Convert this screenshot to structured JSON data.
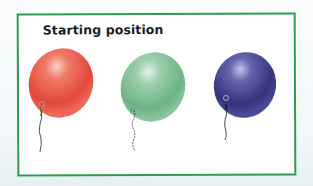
{
  "diagram": {
    "title": "Starting position",
    "frame_color": "#2f9a52",
    "balloons": [
      {
        "label": "red-balloon",
        "color": "#e8584a",
        "highlight": "#f9c2b8",
        "shade": "#c83a30"
      },
      {
        "label": "green-balloon",
        "color": "#7dbf95",
        "highlight": "#d6ecdd",
        "shade": "#5ea57a"
      },
      {
        "label": "blue-balloon",
        "color": "#3f3f8f",
        "highlight": "#a9a9d8",
        "shade": "#2b2b6e"
      }
    ]
  }
}
